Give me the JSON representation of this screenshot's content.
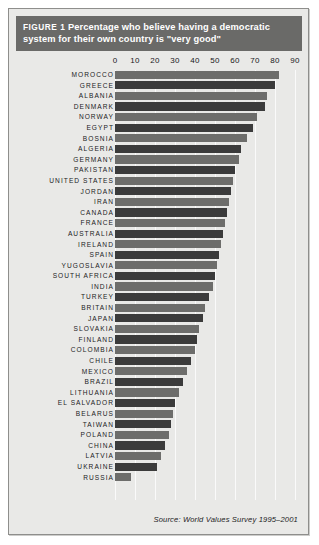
{
  "figure": {
    "label": "FIGURE 1",
    "title": "Percentage who believe having a democratic system for their own country is \"very good\"",
    "source": "Source: World Values Survey 1995–2001"
  },
  "colors": {
    "banner_background": "#6a6a68",
    "banner_text": "#ffffff",
    "card_background": "#e9e9e7",
    "bar_light": "#6d6d6b",
    "bar_dark": "#3b3b3b",
    "gridline": "#fafafa",
    "text": "#1b1b1d"
  },
  "chart_data": {
    "type": "bar",
    "orientation": "horizontal",
    "title": "FIGURE 1 Percentage who believe having a democratic system for their own country is \"very good\"",
    "xlabel": "",
    "ylabel": "",
    "xlim": [
      0,
      90
    ],
    "xticks": [
      0,
      10,
      20,
      30,
      40,
      50,
      60,
      70,
      80,
      90
    ],
    "grid": true,
    "legend": false,
    "source": "Source: World Values Survey 1995–2001",
    "categories": [
      "MOROCCO",
      "GREECE",
      "ALBANIA",
      "DENMARK",
      "NORWAY",
      "EGYPT",
      "BOSNIA",
      "ALGERIA",
      "GERMANY",
      "PAKISTAN",
      "UNITED STATES",
      "JORDAN",
      "IRAN",
      "CANADA",
      "FRANCE",
      "AUSTRALIA",
      "IRELAND",
      "SPAIN",
      "YUGOSLAVIA",
      "SOUTH AFRICA",
      "INDIA",
      "TURKEY",
      "BRITAIN",
      "JAPAN",
      "SLOVAKIA",
      "FINLAND",
      "COLOMBIA",
      "CHILE",
      "MEXICO",
      "BRAZIL",
      "LITHUANIA",
      "EL SALVADOR",
      "BELARUS",
      "TAIWAN",
      "POLAND",
      "CHINA",
      "LATVIA",
      "UKRAINE",
      "RUSSIA"
    ],
    "values": [
      82,
      80,
      76,
      75,
      71,
      69,
      66,
      63,
      62,
      60,
      59,
      58,
      57,
      56,
      55,
      54,
      53,
      52,
      51,
      50,
      49,
      47,
      45,
      44,
      42,
      41,
      40,
      38,
      36,
      34,
      32,
      30,
      29,
      28,
      27,
      25,
      23,
      21,
      8
    ]
  }
}
